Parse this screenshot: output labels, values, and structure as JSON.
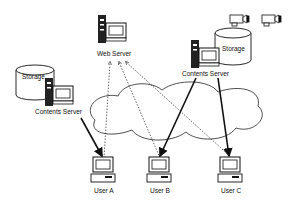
{
  "diagram": {
    "type": "network-architecture",
    "nodes": {
      "web_server": {
        "label": "Web Server"
      },
      "contents_server_left": {
        "label": "Contents Server",
        "storage_label": "Storage"
      },
      "contents_server_right": {
        "label": "Contents Server",
        "storage_label": "Storage"
      },
      "user_a": {
        "label": "User A"
      },
      "user_b": {
        "label": "User B"
      },
      "user_c": {
        "label": "User C"
      }
    },
    "cameras": [
      "video-camera-1",
      "video-camera-2"
    ],
    "network": "cloud",
    "edges": [
      {
        "from": "user_a",
        "to": "web_server",
        "style": "dotted"
      },
      {
        "from": "user_b",
        "to": "web_server",
        "style": "dotted"
      },
      {
        "from": "user_c",
        "to": "web_server",
        "style": "dotted"
      },
      {
        "from": "contents_server_left",
        "to": "user_a",
        "style": "solid-bold"
      },
      {
        "from": "contents_server_right",
        "to": "user_b",
        "style": "solid-bold"
      },
      {
        "from": "contents_server_right",
        "to": "user_c",
        "style": "solid-bold"
      }
    ],
    "colors": {
      "stroke": "#111111",
      "background": "#ffffff"
    }
  }
}
